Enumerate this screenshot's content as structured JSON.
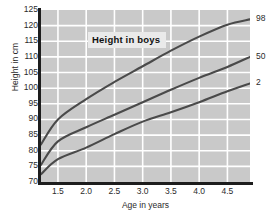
{
  "chart_data": {
    "type": "line",
    "title": "Height in boys",
    "xlabel": "Age in years",
    "ylabel": "Height in cm",
    "xlim": [
      1.2,
      4.9
    ],
    "ylim": [
      70,
      125
    ],
    "grid": true,
    "legend_position": "right-of-axis",
    "xticks": [
      "1.5",
      "2.0",
      "2.5",
      "3.0",
      "3.5",
      "4.0",
      "4.5"
    ],
    "xtick_values": [
      1.5,
      2.0,
      2.5,
      3.0,
      3.5,
      4.0,
      4.5
    ],
    "yticks": [
      "125",
      "120",
      "115",
      "110",
      "105",
      "100",
      "95",
      "90",
      "85",
      "80",
      "75",
      "70"
    ],
    "ytick_values": [
      125,
      120,
      115,
      110,
      105,
      100,
      95,
      90,
      85,
      80,
      75,
      70
    ],
    "right_labels": [
      "98",
      "50",
      "2"
    ],
    "x": [
      1.2,
      1.5,
      2.0,
      2.5,
      3.0,
      3.5,
      4.0,
      4.5,
      4.9
    ],
    "series": [
      {
        "name": "98",
        "label": "98",
        "values": [
          82.0,
          90.0,
          96.5,
          102.0,
          107.0,
          112.0,
          116.5,
          120.3,
          122.0
        ]
      },
      {
        "name": "50",
        "label": "50",
        "values": [
          75.5,
          83.0,
          87.5,
          91.5,
          95.5,
          99.5,
          103.3,
          106.8,
          110.0
        ]
      },
      {
        "name": "2",
        "label": "2",
        "values": [
          72.5,
          77.3,
          81.0,
          85.3,
          89.3,
          92.3,
          95.5,
          99.0,
          101.5
        ]
      }
    ],
    "colors": {
      "plot_background": "#c9c9c9",
      "gridline": "#ffffff",
      "curve": "#4a4a4a",
      "axis": "#1d1d1d",
      "text": "#2b2b2b",
      "title_box_background": "#eaeaea"
    }
  }
}
